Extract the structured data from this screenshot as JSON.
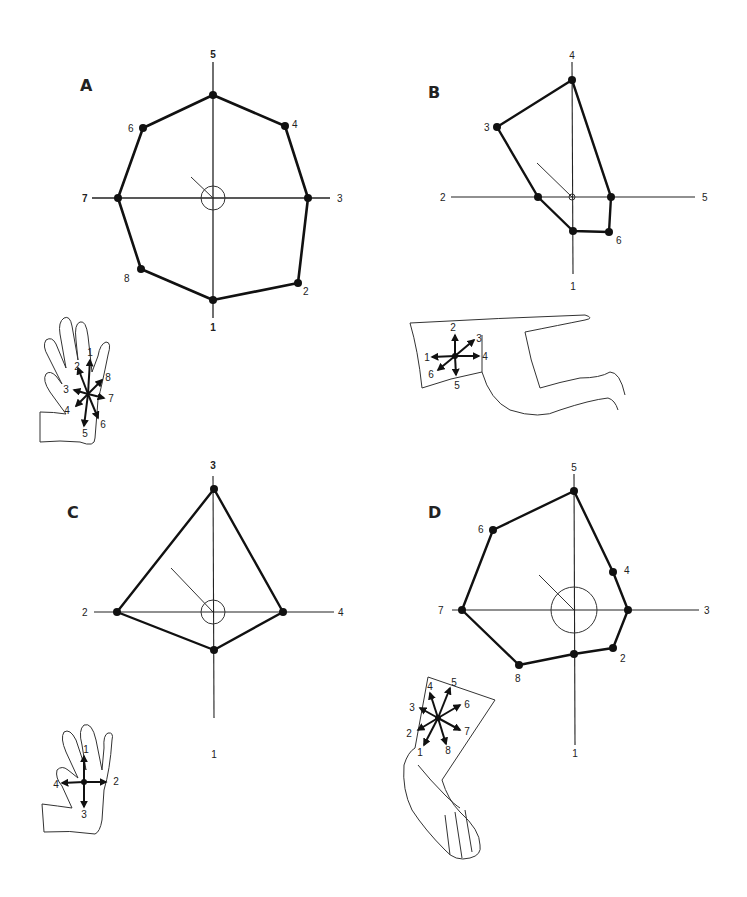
{
  "panels": [
    {
      "id": "A",
      "label": "A",
      "axis_labels": {
        "top": "5",
        "right": "3",
        "bottom": "1",
        "left": "7"
      },
      "point_labels": [
        "6",
        "4",
        "8",
        "2"
      ],
      "inset": {
        "type": "hand",
        "directions": [
          "1",
          "2",
          "3",
          "4",
          "5",
          "6",
          "7",
          "8"
        ]
      }
    },
    {
      "id": "B",
      "label": "B",
      "axis_labels": {
        "top": "4",
        "right": "5",
        "bottom": "1",
        "left": "2"
      },
      "point_labels": [
        "3",
        "6"
      ],
      "inset": {
        "type": "arm",
        "directions": [
          "1",
          "2",
          "3",
          "4",
          "5",
          "6"
        ]
      }
    },
    {
      "id": "C",
      "label": "C",
      "axis_labels": {
        "top": "3",
        "right": "4",
        "bottom": "1",
        "left": "2"
      },
      "point_labels": [],
      "inset": {
        "type": "hand",
        "directions": [
          "1",
          "2",
          "3",
          "4"
        ]
      }
    },
    {
      "id": "D",
      "label": "D",
      "axis_labels": {
        "top": "5",
        "right": "3",
        "bottom": "1",
        "left": "7"
      },
      "point_labels": [
        "6",
        "4",
        "8",
        "2"
      ],
      "inset": {
        "type": "leg-foot",
        "directions": [
          "1",
          "2",
          "3",
          "4",
          "5",
          "6",
          "7",
          "8"
        ]
      }
    }
  ]
}
